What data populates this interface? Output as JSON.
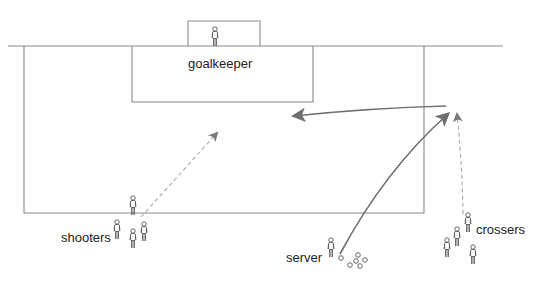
{
  "diagram": {
    "colors": {
      "field_line": "#8a8a8a",
      "arrow_solid": "#6e6e6e",
      "arrow_dashed": "#a8a8a8",
      "player": "#555555",
      "text": "#222222"
    },
    "labels": {
      "goalkeeper": "goalkeeper",
      "shooters": "shooters",
      "server": "server",
      "crossers": "crossers"
    },
    "groups": [
      {
        "name": "goalkeeper",
        "label": "goalkeeper",
        "count": 1
      },
      {
        "name": "shooters",
        "label": "shooters",
        "count": 4
      },
      {
        "name": "server",
        "label": "server",
        "count": 1,
        "balls": 6
      },
      {
        "name": "crossers",
        "label": "crossers",
        "count": 4
      }
    ],
    "arrows": [
      {
        "from": "server",
        "to": "crossing-zone",
        "style": "solid"
      },
      {
        "from": "crossers",
        "to": "crossing-zone",
        "style": "dashed"
      },
      {
        "from": "crossing-zone",
        "to": "penalty-area",
        "style": "solid"
      },
      {
        "from": "shooters",
        "to": "penalty-area",
        "style": "dashed"
      }
    ]
  }
}
